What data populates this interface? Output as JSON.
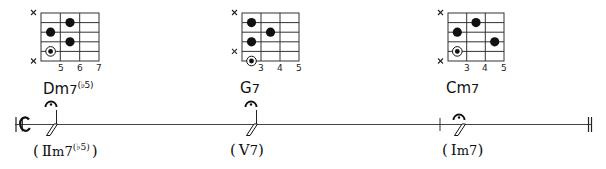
{
  "colors": {
    "ink": "#111111",
    "line": "#444444",
    "background": "#ffffff"
  },
  "staff": {
    "time_signature": "common-time",
    "final_barline": "double"
  },
  "chords": [
    {
      "name": "Dm",
      "name_suffix": "7",
      "name_sup": "(♭5)",
      "roman_numeral": "Ⅱ",
      "roman_suffix": "m7",
      "roman_sup": "(♭5)",
      "fret_labels": [
        "5",
        "6",
        "7"
      ],
      "muted_strings": [
        1,
        6
      ],
      "dots": [
        {
          "string": 2,
          "fret_col": 2
        },
        {
          "string": 3,
          "fret_col": 1
        },
        {
          "string": 4,
          "fret_col": 2
        }
      ],
      "root": {
        "string": 5,
        "fret_col": 1
      },
      "fermata": true
    },
    {
      "name": "G",
      "name_suffix": "7",
      "name_sup": "",
      "roman_numeral": "Ⅴ",
      "roman_suffix": "7",
      "roman_sup": "",
      "fret_labels": [
        "3",
        "4",
        "5"
      ],
      "muted_strings": [
        1,
        5
      ],
      "dots": [
        {
          "string": 2,
          "fret_col": 1
        },
        {
          "string": 3,
          "fret_col": 2
        },
        {
          "string": 4,
          "fret_col": 1
        }
      ],
      "root": {
        "string": 6,
        "fret_col": 1
      },
      "fermata": true
    },
    {
      "name": "Cm",
      "name_suffix": "7",
      "name_sup": "",
      "roman_numeral": "Ⅰ",
      "roman_suffix": "m7",
      "roman_sup": "",
      "fret_labels": [
        "3",
        "4",
        "5"
      ],
      "muted_strings": [
        1,
        6
      ],
      "dots": [
        {
          "string": 2,
          "fret_col": 2
        },
        {
          "string": 3,
          "fret_col": 1
        },
        {
          "string": 4,
          "fret_col": 3
        }
      ],
      "root": {
        "string": 5,
        "fret_col": 1
      },
      "fermata": true
    }
  ],
  "punctuation": {
    "open": "(",
    "close": ")",
    "mute_mark": "×"
  }
}
